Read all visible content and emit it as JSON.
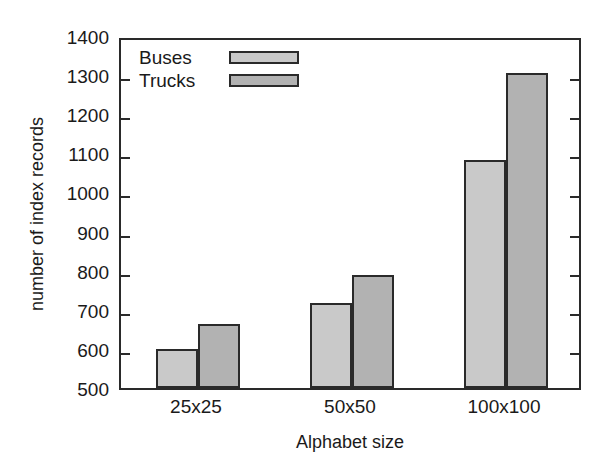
{
  "chart_data": {
    "type": "bar",
    "title": "",
    "xlabel": "Alphabet size",
    "ylabel": "number of index records",
    "categories": [
      "25x25",
      "50x50",
      "100x100"
    ],
    "series": [
      {
        "name": "Buses",
        "values": [
          600,
          717,
          1083
        ],
        "color": "#c9c9c9"
      },
      {
        "name": "Trucks",
        "values": [
          663,
          789,
          1305
        ],
        "color": "#b2b2b2"
      }
    ],
    "ylim": [
      500,
      1400
    ],
    "ytick_labels": [
      "500",
      "600",
      "700",
      "800",
      "900",
      "1000",
      "1100",
      "1200",
      "1300",
      "1400"
    ],
    "ytick_values": [
      500,
      600,
      700,
      800,
      900,
      1000,
      1100,
      1200,
      1300,
      1400
    ],
    "grid": false,
    "legend_position": "top-left-inside",
    "legend_entries": [
      "Buses",
      "Trucks"
    ],
    "axis_color": "#2a2a2a",
    "background": "#ffffff"
  }
}
